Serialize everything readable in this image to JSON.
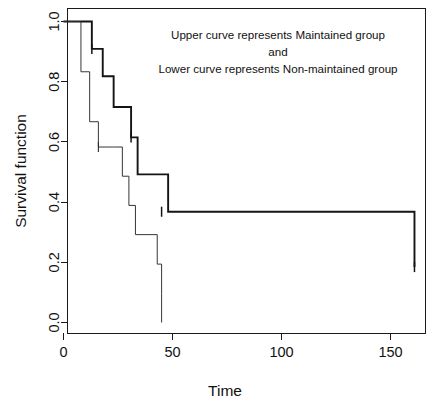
{
  "chart_data": {
    "type": "line",
    "title": "",
    "xlabel": "Time",
    "ylabel": "Survival function",
    "xlim": [
      -4,
      168
    ],
    "ylim": [
      -0.04,
      1.04
    ],
    "xticks": [
      0,
      50,
      100,
      150
    ],
    "xticklabels": [
      "0",
      "50",
      "100",
      "150"
    ],
    "yticks": [
      0.0,
      0.2,
      0.4,
      0.6,
      0.8,
      1.0
    ],
    "yticklabels": [
      "0.0",
      "0.2",
      "0.4",
      "0.6",
      "0.8",
      "1.0"
    ],
    "grid": false,
    "legend_position": "none",
    "annotations": [
      "Upper curve represents Maintained group",
      "and",
      "Lower curve represents Non-maintained group"
    ],
    "series": [
      {
        "name": "Maintained group",
        "style": "step-post",
        "linewidth": "bold",
        "x": [
          0,
          9,
          13,
          18,
          23,
          31,
          34,
          48,
          161
        ],
        "y": [
          1.0,
          1.0,
          0.909,
          0.818,
          0.716,
          0.615,
          0.492,
          0.368,
          0.184
        ],
        "censored_x": [
          13,
          31,
          45,
          161
        ],
        "censored_y": [
          0.909,
          0.615,
          0.368,
          0.184
        ]
      },
      {
        "name": "Non-maintained group",
        "style": "step-post",
        "linewidth": "thin",
        "x": [
          0,
          5,
          8,
          12,
          16,
          23,
          27,
          30,
          33,
          43,
          45
        ],
        "y": [
          1.0,
          1.0,
          0.833,
          0.667,
          0.583,
          0.583,
          0.486,
          0.389,
          0.292,
          0.194,
          0.097
        ],
        "final_x": 45,
        "final_y": 0.0,
        "censored_x": [
          16
        ],
        "censored_y": [
          0.583
        ]
      }
    ]
  },
  "plot": {
    "ylabel": "Survival function",
    "xlabel": "Time",
    "annotation_line1": "Upper curve represents Maintained group",
    "annotation_line2": "and",
    "annotation_line3": "Lower curve represents Non-maintained group",
    "ytick_0": "0.0",
    "ytick_1": "0.2",
    "ytick_2": "0.4",
    "ytick_3": "0.6",
    "ytick_4": "0.8",
    "ytick_5": "1.0",
    "xtick_0": "0",
    "xtick_1": "50",
    "xtick_2": "100",
    "xtick_3": "150"
  },
  "colors": {
    "background": "#ffffff",
    "axis": "#1a1a1a",
    "curve_maintained": "#141414",
    "curve_nonmaintained": "#2b2b2b",
    "text": "#111111"
  }
}
